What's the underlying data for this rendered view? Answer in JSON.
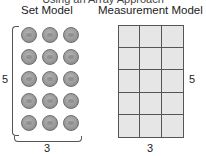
{
  "figure": {
    "partial_title": "Using an Array Approach",
    "set_model": {
      "heading": "Set Model",
      "rows": 5,
      "cols": 3,
      "row_label": "5",
      "col_label": "3",
      "item": "coin-icon"
    },
    "measurement_model": {
      "heading": "Measurement Model",
      "rows": 5,
      "cols": 3,
      "row_label": "5",
      "col_label": "3",
      "cell_color": "#e6e6e6",
      "line_color": "#555555"
    }
  }
}
